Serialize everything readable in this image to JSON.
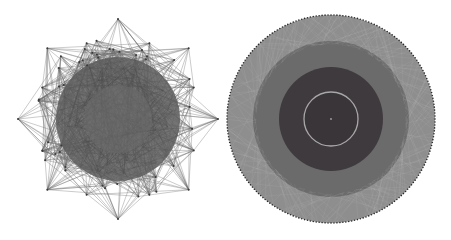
{
  "figure": {
    "panels": [
      {
        "id": "left",
        "description": "Force-directed network layout with octagonal/star outer hull and dense dark core",
        "center": [
          118,
          119
        ],
        "hull_radius": 100,
        "core_radius": 62,
        "outer_spikes": 16,
        "colors": {
          "edge": "#6a6a6a",
          "core": "#5c5c5c",
          "node": "#3a3a3a"
        }
      },
      {
        "id": "right",
        "description": "Circular concentric network layout with shaded rings",
        "center": [
          331,
          119
        ],
        "rings": [
          {
            "radius": 104,
            "color": "#8e8e8e"
          },
          {
            "radius": 78,
            "color": "#6b6b6b"
          },
          {
            "radius": 52,
            "color": "#3f3a3d"
          },
          {
            "radius": 27,
            "color": "#3a3538",
            "stroke": "#a8a8a8"
          }
        ],
        "node_color": "#2a2a2a"
      }
    ]
  }
}
